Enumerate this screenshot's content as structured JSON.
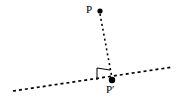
{
  "figure": {
    "name": "perpendicular-projection-diagram",
    "background_color": "#ffffff",
    "stroke_color": "#000000",
    "width": 187,
    "height": 104
  },
  "labels": {
    "point_p": "P",
    "point_p_prime": "P′"
  },
  "points": [
    {
      "id": "P",
      "label": "P",
      "x": 100,
      "y": 11,
      "radius": 2.6,
      "filled": true
    },
    {
      "id": "Pp",
      "label": "P′",
      "x": 112,
      "y": 80,
      "radius": 3.2,
      "filled": true
    }
  ],
  "segments": [
    {
      "id": "projection-segment",
      "name": "segment-P-to-Pprime",
      "x1": 100,
      "y1": 13,
      "x2": 112,
      "y2": 79,
      "style": "dashed",
      "dash": "2 3",
      "width": 1.6
    },
    {
      "id": "transversal-line",
      "name": "dashed-base-line",
      "x1": 13,
      "y1": 91,
      "x2": 173,
      "y2": 67,
      "style": "dashed",
      "dash": "3 3",
      "width": 1.7
    }
  ],
  "right_angle_marker": {
    "name": "right-angle-square",
    "points": "97,80 97,68 110,70",
    "style": "solid",
    "width": 1
  },
  "colors": {
    "ink": "#000000",
    "paper": "#ffffff"
  }
}
